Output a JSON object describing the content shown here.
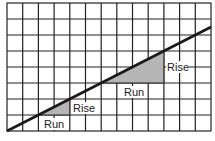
{
  "diagram": {
    "grid": {
      "columns": 13,
      "rows": 8,
      "line_color": "#222222",
      "background": "#ffffff"
    },
    "line": {
      "color": "#1a1a1a",
      "from": [
        0,
        0
      ],
      "to": [
        13,
        6.7
      ]
    },
    "triangles": [
      {
        "fill": "#b5b5b5",
        "rise_label": "Rise",
        "run_label": "Run"
      },
      {
        "fill": "#b5b5b5",
        "rise_label": "Rise",
        "run_label": "Run"
      }
    ]
  }
}
